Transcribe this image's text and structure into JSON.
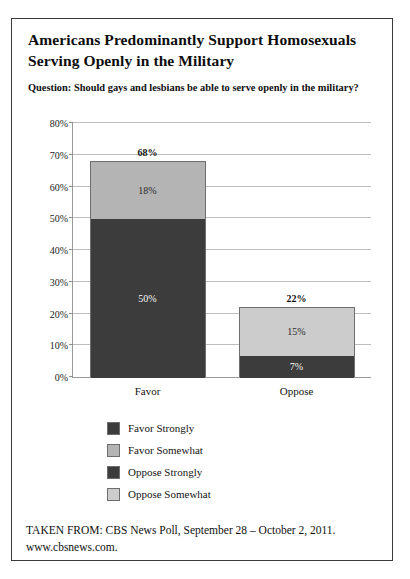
{
  "frame": {
    "border_color": "#3a3a3a"
  },
  "title": {
    "line1": "Americans Predominantly Support Homosexuals",
    "line2": "Serving Openly in the Military"
  },
  "question": "Question: Should gays and lesbians be able to serve openly in the military?",
  "legend": {
    "items": [
      {
        "label": "Favor Strongly",
        "color": "#3c3c3c"
      },
      {
        "label": "Favor Somewhat",
        "color": "#b4b4b4"
      },
      {
        "label": "Oppose Strongly",
        "color": "#3c3c3c"
      },
      {
        "label": "Oppose Somewhat",
        "color": "#cccccc"
      }
    ]
  },
  "footer": {
    "line1": "TAKEN FROM: CBS News Poll, September 28 – October 2, 2011.",
    "line2": "www.cbsnews.com."
  },
  "chart_data": {
    "type": "bar",
    "subtype": "stacked",
    "title": "Americans Predominantly Support Homosexuals Serving Openly in the Military",
    "subtitle": "Question: Should gays and lesbians be able to serve openly in the military?",
    "xlabel": "",
    "ylabel": "",
    "categories": [
      "Favor",
      "Oppose"
    ],
    "ylim": [
      0,
      80
    ],
    "ytick_labels": [
      "0%",
      "10%",
      "20%",
      "30%",
      "40%",
      "50%",
      "60%",
      "70%",
      "80%"
    ],
    "ytick_values": [
      0,
      10,
      20,
      30,
      40,
      50,
      60,
      70,
      80
    ],
    "grid": true,
    "legend_position": "bottom",
    "series": [
      {
        "name": "Favor Strongly",
        "values": [
          50,
          null
        ],
        "color": "#3c3c3c"
      },
      {
        "name": "Favor Somewhat",
        "values": [
          18,
          null
        ],
        "color": "#b4b4b4"
      },
      {
        "name": "Oppose Strongly",
        "values": [
          null,
          7
        ],
        "color": "#3c3c3c"
      },
      {
        "name": "Oppose Somewhat",
        "values": [
          null,
          15
        ],
        "color": "#cccccc"
      }
    ],
    "totals": [
      68,
      22
    ],
    "total_labels": [
      "68%",
      "22%"
    ],
    "bars": [
      {
        "category": "Favor",
        "total": 68,
        "total_label": "68%",
        "segments": [
          {
            "name": "Favor Strongly",
            "value": 50,
            "label": "50%",
            "color": "#3c3c3c",
            "text_color": "#ffffff"
          },
          {
            "name": "Favor Somewhat",
            "value": 18,
            "label": "18%",
            "color": "#b4b4b4",
            "text_color": "#2a2a2a"
          }
        ]
      },
      {
        "category": "Oppose",
        "total": 22,
        "total_label": "22%",
        "segments": [
          {
            "name": "Oppose Strongly",
            "value": 7,
            "label": "7%",
            "color": "#3c3c3c",
            "text_color": "#ffffff"
          },
          {
            "name": "Oppose Somewhat",
            "value": 15,
            "label": "15%",
            "color": "#cccccc",
            "text_color": "#2a2a2a"
          }
        ]
      }
    ]
  }
}
